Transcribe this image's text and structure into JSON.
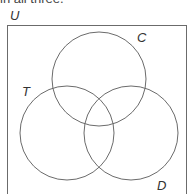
{
  "caption": "in all three.",
  "diagram": {
    "type": "venn",
    "universe_label": "U",
    "sets": [
      {
        "id": "C",
        "label": "C",
        "cx": 99,
        "cy": 79,
        "r": 47
      },
      {
        "id": "T",
        "label": "T",
        "cx": 67,
        "cy": 133,
        "r": 47
      },
      {
        "id": "D",
        "label": "D",
        "cx": 131,
        "cy": 133,
        "r": 47
      }
    ],
    "stroke_color": "#6b6b6b",
    "frame_color": "#6b6b6b"
  }
}
